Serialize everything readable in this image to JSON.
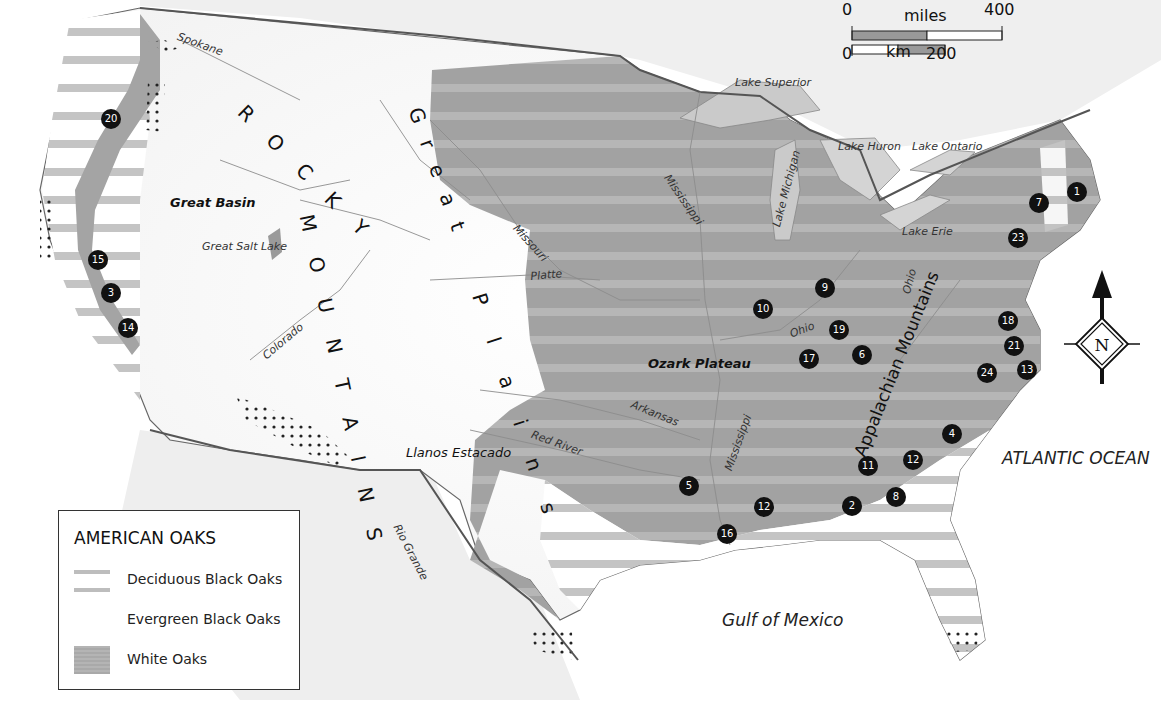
{
  "map": {
    "title": "AMERICAN OAKS",
    "colors": {
      "white_oak_fill": "#a4a4a4",
      "deciduous_stripe": "#bdbdbd",
      "evergreen_fill": "#ffffff",
      "border": "#555555",
      "river": "#8a8a8a",
      "marker": "#111111",
      "lake": "#c9c9c9"
    }
  },
  "legend": {
    "title": "AMERICAN OAKS",
    "items": [
      {
        "label": "Deciduous Black Oaks",
        "swatch": "horizontal-stripes"
      },
      {
        "label": "Evergreen Black Oaks",
        "swatch": "none"
      },
      {
        "label": "White Oaks",
        "swatch": "gray-fill"
      }
    ]
  },
  "scale_bar": {
    "miles_label": "miles",
    "miles_start": "0",
    "miles_end": "400",
    "km_label": "km",
    "km_start": "0",
    "km_end": "200"
  },
  "compass": {
    "label": "N",
    "icon": "north-arrow-icon"
  },
  "labels": {
    "rocky_mountains_1": "R O C K Y",
    "rocky_mountains_2": "M O U N T A I N S",
    "great_plains_1": "G r e a t",
    "great_plains_2": "P l a i n s",
    "appalachian": "Appalachian Mountains",
    "great_basin": "Great Basin",
    "great_salt_lake": "Great Salt Lake",
    "ozark_plateau": "Ozark Plateau",
    "llanos_estacado": "Llanos Estacado",
    "atlantic": "ATLANTIC OCEAN",
    "gulf": "Gulf of Mexico",
    "lake_superior": "Lake Superior",
    "lake_michigan": "Lake Michigan",
    "lake_huron": "Lake Huron",
    "lake_ontario": "Lake Ontario",
    "lake_erie": "Lake Erie"
  },
  "rivers": [
    {
      "name": "Spokane",
      "x": 180,
      "y": 30,
      "rot": 20
    },
    {
      "name": "Missouri",
      "x": 520,
      "y": 222,
      "rot": 48
    },
    {
      "name": "Platte",
      "x": 530,
      "y": 270,
      "rot": -5
    },
    {
      "name": "Mississippi",
      "x": 672,
      "y": 178,
      "rot": 55
    },
    {
      "name": "Colorado",
      "x": 256,
      "y": 332,
      "rot": -40
    },
    {
      "name": "Ohio",
      "x": 788,
      "y": 322,
      "rot": -20
    },
    {
      "name": "Ohio",
      "x": 891,
      "y": 278,
      "rot": -75
    },
    {
      "name": "Arkansas",
      "x": 632,
      "y": 408,
      "rot": 22
    },
    {
      "name": "Red River",
      "x": 532,
      "y": 436,
      "rot": 20
    },
    {
      "name": "Mississippi",
      "x": 700,
      "y": 440,
      "rot": -70
    },
    {
      "name": "Rio Grande",
      "x": 392,
      "y": 534,
      "rot": 60
    }
  ],
  "markers": [
    {
      "num": "1",
      "x": 1077,
      "y": 192
    },
    {
      "num": "2",
      "x": 852,
      "y": 506
    },
    {
      "num": "3",
      "x": 111,
      "y": 293
    },
    {
      "num": "4",
      "x": 952,
      "y": 434
    },
    {
      "num": "5",
      "x": 689,
      "y": 486
    },
    {
      "num": "6",
      "x": 862,
      "y": 355
    },
    {
      "num": "7",
      "x": 1039,
      "y": 203
    },
    {
      "num": "8",
      "x": 896,
      "y": 497
    },
    {
      "num": "9",
      "x": 825,
      "y": 288
    },
    {
      "num": "10",
      "x": 763,
      "y": 309
    },
    {
      "num": "11",
      "x": 868,
      "y": 466
    },
    {
      "num": "12",
      "x": 913,
      "y": 460
    },
    {
      "num": "12",
      "x": 764,
      "y": 507
    },
    {
      "num": "13",
      "x": 1027,
      "y": 370
    },
    {
      "num": "14",
      "x": 128,
      "y": 328
    },
    {
      "num": "15",
      "x": 98,
      "y": 260
    },
    {
      "num": "16",
      "x": 727,
      "y": 534
    },
    {
      "num": "17",
      "x": 809,
      "y": 359
    },
    {
      "num": "18",
      "x": 1008,
      "y": 321
    },
    {
      "num": "19",
      "x": 839,
      "y": 330
    },
    {
      "num": "20",
      "x": 111,
      "y": 119
    },
    {
      "num": "21",
      "x": 1014,
      "y": 346
    },
    {
      "num": "23",
      "x": 1018,
      "y": 238
    },
    {
      "num": "24",
      "x": 987,
      "y": 373
    }
  ]
}
